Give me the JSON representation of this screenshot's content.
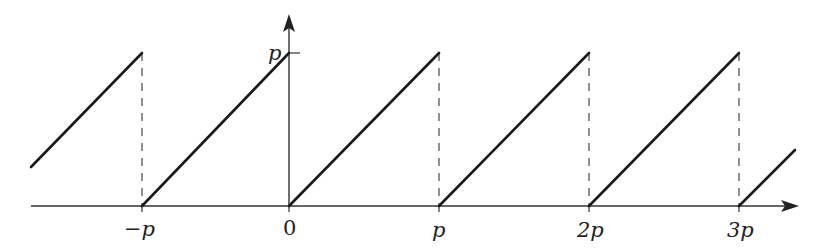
{
  "diagram": {
    "type": "sawtooth-wave",
    "colors": {
      "stroke": "#1a1a1a",
      "axis": "#333333",
      "dashed": "#555555",
      "background": "#ffffff"
    },
    "axes": {
      "x_ticks": [
        {
          "id": "neg_p",
          "label": "−p"
        },
        {
          "id": "zero",
          "label": "0"
        },
        {
          "id": "p",
          "label": "p"
        },
        {
          "id": "two_p",
          "label": "2p"
        },
        {
          "id": "three_p",
          "label": "3p"
        }
      ],
      "y_ticks": [
        {
          "id": "p",
          "label": "p"
        }
      ]
    },
    "labels": {
      "neg_p": "−p",
      "zero": "0",
      "p_x": "p",
      "two_p": "2p",
      "three_p": "3p",
      "p_y": "p"
    }
  }
}
